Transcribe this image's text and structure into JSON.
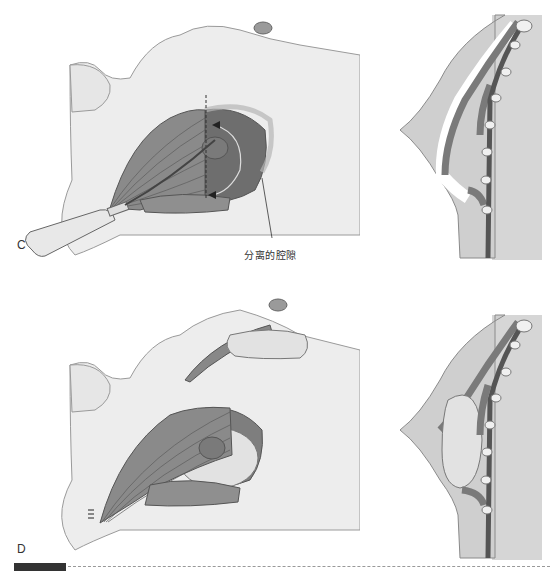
{
  "figure": {
    "panels": [
      {
        "id": "C",
        "label": "C",
        "description": "Left-lateral body view with pectoralis muscle retracted and dissector instrument creating pocket; dashed incision line and curved arrows; sagittal cross-section at right showing dissected submuscular pocket",
        "callout": "分离的腔隙"
      },
      {
        "id": "D",
        "label": "D",
        "description": "Left-lateral body view with implant placed beneath pectoralis muscle and inset showing implant in pocket; sagittal cross-section at right showing implant seated behind muscle"
      }
    ],
    "footer": {
      "bar": "",
      "line": "dashed"
    }
  },
  "colors": {
    "skin": "#ededed",
    "skin_outline": "#9a9a9a",
    "muscle": "#8a8a8a",
    "muscle_dark": "#555555",
    "pocket": "#6e6e6e",
    "implant": "#e2e2e2",
    "chest_wall": "#d6d6d6",
    "text": "#333333"
  }
}
